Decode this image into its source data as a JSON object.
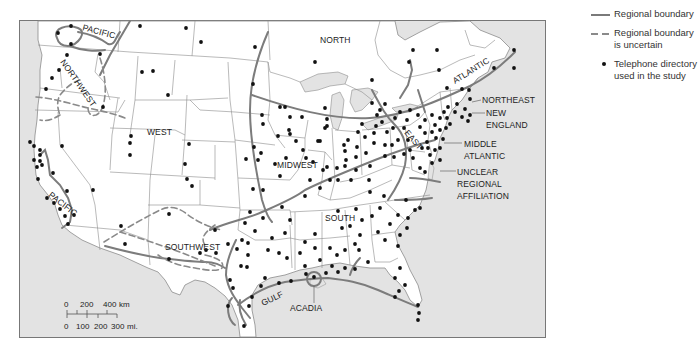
{
  "legend": {
    "items": [
      {
        "symbol": "solid-line",
        "label": "Regional boundary"
      },
      {
        "symbol": "dashed-line",
        "label": "Regional boundary is uncertain"
      },
      {
        "symbol": "dot",
        "label": "Telephone directory used in the study"
      }
    ],
    "regional_boundary_label": "Regional boundary",
    "uncertain_line1": "Regional boundary",
    "uncertain_line2": "is uncertain",
    "dot_line1": "Telephone directory",
    "dot_line2": "used in the study"
  },
  "regions": {
    "north": "NORTH",
    "pacific_north": "PACIFIC",
    "northwest": "NORTHWEST",
    "west": "WEST",
    "pacific_south": "PACIFIC",
    "southwest": "SOUTHWEST",
    "midwest": "MIDWEST",
    "south": "SOUTH",
    "gulf": "GULF",
    "acadia": "ACADIA",
    "atlantic": "ATLANTIC",
    "east": "EAST",
    "northeast": "NORTHEAST",
    "new_england_1": "NEW",
    "new_england_2": "ENGLAND",
    "middle_atlantic_1": "MIDDLE",
    "middle_atlantic_2": "ATLANTIC",
    "unclear_1": "UNCLEAR",
    "unclear_2": "REGIONAL",
    "unclear_3": "AFFILIATION"
  },
  "scale_bar": {
    "km_labels": [
      "0",
      "200",
      "400 km"
    ],
    "mi_labels": [
      "0",
      "100",
      "200",
      "300 mi."
    ]
  },
  "colors": {
    "water": "#e3e3e3",
    "land": "#ffffff",
    "state_border": "#8c8c8c",
    "regional_boundary": "#7c7c7c",
    "dot": "#111111"
  }
}
